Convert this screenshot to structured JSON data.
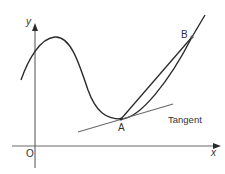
{
  "diagram": {
    "type": "tangent-and-chord-on-curve",
    "axes": {
      "x_label": "x",
      "y_label": "y",
      "origin_label": "O"
    },
    "points": {
      "A": {
        "label": "A"
      },
      "B": {
        "label": "B"
      }
    },
    "tangent_label": "Tangent",
    "colors": {
      "curve": "#2b2b2b",
      "chord": "#2b2b2b",
      "tangent": "#6a6a6a",
      "axes": "#6a6a6a",
      "text": "#333333"
    }
  }
}
